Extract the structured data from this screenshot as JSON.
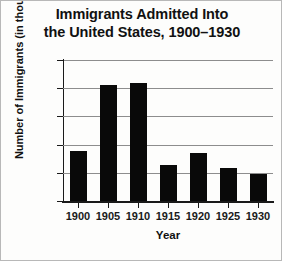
{
  "chart_data": {
    "type": "bar",
    "title": "Immigrants Admitted Into the United States, 1900–1930",
    "title_lines": [
      "Immigrants Admitted Into",
      "the United States, 1900–1930"
    ],
    "xlabel": "Year",
    "ylabel": "Number of Immigrants (in thousands)",
    "categories": [
      "1900",
      "1905",
      "1910",
      "1915",
      "1920",
      "1925",
      "1930"
    ],
    "values": [
      440,
      1030,
      1045,
      320,
      430,
      295,
      240
    ],
    "ylim": [
      0,
      1250
    ],
    "yticks": [
      0,
      250,
      500,
      750,
      1000,
      1250
    ],
    "ytick_labels": [
      "0",
      "250",
      "500",
      "750",
      "1,000",
      "1,250"
    ],
    "grid": true,
    "legend": false,
    "bar_color": "#090909",
    "grid_color": "#8d8d8d",
    "axis_color": "#1a1a1a",
    "background": "#fdfdfc"
  }
}
